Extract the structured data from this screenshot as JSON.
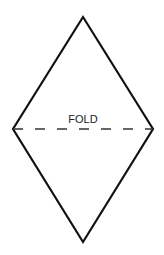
{
  "diagram": {
    "shape": "diamond",
    "fold_label": "FOLD",
    "stroke_color": "#111111",
    "vertices": {
      "top": [
        83,
        17
      ],
      "left": [
        13,
        129
      ],
      "right": [
        153,
        129
      ],
      "bottom": [
        83,
        242
      ]
    },
    "fold_line": {
      "style": "dashed",
      "y": 129
    }
  }
}
